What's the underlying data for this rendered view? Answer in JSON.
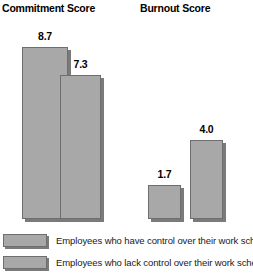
{
  "chart_data": {
    "type": "bar",
    "title": "",
    "xlabel": "",
    "ylabel": "",
    "grid": false,
    "ylim": [
      0,
      11.3
    ],
    "legend_position": "bottom",
    "panels": [
      {
        "title": "Commitment Score",
        "categories": [
          "Employees who have control over their work schedules",
          "Employees who lack control over their work schedules"
        ],
        "values": [
          8.7,
          7.3
        ],
        "labels": [
          "8.7",
          "7.3"
        ]
      },
      {
        "title": "Burnout Score",
        "categories": [
          "Employees who have control over their work schedules",
          "Employees who lack control over their work schedules"
        ],
        "values": [
          1.7,
          4.0
        ],
        "labels": [
          "1.7",
          "4.0"
        ]
      }
    ],
    "series": [
      {
        "name": "Employees who have control over their work schedules",
        "values": [
          8.7,
          1.7
        ]
      },
      {
        "name": "Employees who lack control over their work schedules",
        "values": [
          7.3,
          4.0
        ]
      }
    ],
    "categories": [
      "Commitment Score",
      "Burnout Score"
    ],
    "colors": {
      "bar_fill": "#a8a8a8",
      "bar_border": "#6e6e6e",
      "bar_shadow": "#7a7a7a",
      "text": "#000000",
      "background": "#ffffff"
    }
  },
  "legend": {
    "items": [
      {
        "label": "Employees who have control over their work schedules"
      },
      {
        "label": "Employees who lack control over their work schedules"
      }
    ]
  }
}
